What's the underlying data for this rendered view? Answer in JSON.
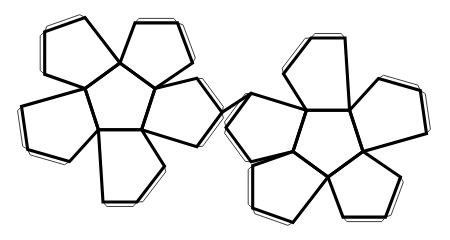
{
  "document": {
    "title": "Dodecahedron Net",
    "subject": "regular dodecahedron papercraft unfolding",
    "background_color": "#ffffff",
    "line_color": "#000000",
    "tab_line_color": "#2a2a2a",
    "face_fill_color": "#ffffff",
    "width": 450,
    "height": 240
  },
  "figure": {
    "type": "polyhedron-net",
    "solid": "dodecahedron",
    "face_shape": "regular pentagon",
    "face_count": 12,
    "group_count": 2,
    "faces_per_group": 6,
    "has_glue_tabs": true,
    "tab_offset_px": 4.5,
    "fold_line_width": 3.1,
    "tab_line_width": 0.9
  },
  "groups": [
    {
      "name": "left-flower",
      "center_x": 120,
      "center_y": 104,
      "orientation_deg": 0,
      "faces": [
        {
          "name": "left-center-face",
          "role": "center",
          "points": "120,63 155,88.5 141.6,129.7 98.4,129.7 85,88.5"
        },
        {
          "name": "left-petal-top-left",
          "role": "petal",
          "points": "120,63 85,88.5 44.7,74.3 44.7,31.8 85,17.6"
        },
        {
          "name": "left-petal-top-right",
          "role": "petal",
          "points": "155,88.5 120,63 135,22.9 177.5,22.9 192.5,63"
        },
        {
          "name": "left-petal-right",
          "role": "petal",
          "points": "141.6,129.7 155,88.5 196.8,78.2 222,112.4 196.8,146.7"
        },
        {
          "name": "left-petal-bottom",
          "role": "petal",
          "points": "98.4,129.7 141.6,129.7 164.5,166.1 137,202 103,202"
        },
        {
          "name": "left-petal-left",
          "role": "petal",
          "points": "85,88.5 98.4,129.7 69.5,161.5 27.7,149.5 21.5,106.4"
        }
      ],
      "tabs": [
        {
          "name": "tab-top-left-outer",
          "edge": "44.7,31.8 85,17.6"
        },
        {
          "name": "tab-top-left-lower",
          "edge": "44.7,74.3 44.7,31.8"
        },
        {
          "name": "tab-top-right-outer",
          "edge": "135,22.9 177.5,22.9"
        },
        {
          "name": "tab-top-right-side",
          "edge": "177.5,22.9 192.5,63"
        },
        {
          "name": "tab-right-upper",
          "edge": "196.8,78.2 222,112.4"
        },
        {
          "name": "tab-right-lower",
          "edge": "222,112.4 196.8,146.7"
        },
        {
          "name": "tab-bottom-right",
          "edge": "164.5,166.1 137,202"
        },
        {
          "name": "tab-bottom-base",
          "edge": "137,202 103,202"
        },
        {
          "name": "tab-bottom-left",
          "edge": "103,202 69.5,161.5"
        },
        {
          "name": "tab-left-lower",
          "edge": "69.5,161.5 27.7,149.5"
        },
        {
          "name": "tab-left-outer",
          "edge": "27.7,149.5 21.5,106.4"
        },
        {
          "name": "tab-left-upper",
          "edge": "21.5,106.4 44.7,74.3"
        }
      ]
    },
    {
      "name": "right-flower",
      "center_x": 328,
      "center_y": 136,
      "orientation_deg": 180,
      "faces": [
        {
          "name": "right-center-face",
          "role": "center",
          "points": "328,177 293,151.5 306.4,110.3 349.6,110.3 363,151.5"
        },
        {
          "name": "right-petal-bottom-left",
          "role": "petal",
          "points": "328,177 293,151.5 252.7,165.7 252.7,208.2 293,222.4"
        },
        {
          "name": "right-petal-bottom-right",
          "role": "petal",
          "points": "363,151.5 328,177 343,217.1 385.5,217.1 400.5,177"
        },
        {
          "name": "right-petal-left",
          "role": "petal",
          "points": "306.4,110.3 293,151.5 251.2,161.8 226,127.6 251.2,93.3"
        },
        {
          "name": "right-petal-top",
          "role": "petal",
          "points": "349.6,110.3 306.4,110.3 283.5,73.9 311,38 345,38"
        },
        {
          "name": "right-petal-right",
          "role": "petal",
          "points": "363,151.5 349.6,110.3 378.5,78.5 420.3,90.5 426.5,133.6"
        }
      ],
      "tabs": [
        {
          "name": "tab-r-bottom-left-outer",
          "edge": "252.7,165.7 252.7,208.2"
        },
        {
          "name": "tab-r-bottom-left-base",
          "edge": "252.7,208.2 293,222.4"
        },
        {
          "name": "tab-r-bottom-right-base",
          "edge": "343,217.1 385.5,217.1"
        },
        {
          "name": "tab-r-bottom-right-side",
          "edge": "385.5,217.1 400.5,177"
        },
        {
          "name": "tab-r-left-lower",
          "edge": "251.2,161.8 226,127.6"
        },
        {
          "name": "tab-r-left-upper",
          "edge": "226,127.6 251.2,93.3"
        },
        {
          "name": "tab-r-top-left",
          "edge": "283.5,73.9 311,38"
        },
        {
          "name": "tab-r-top-apex",
          "edge": "311,38 345,38"
        },
        {
          "name": "tab-r-top-right",
          "edge": "345,38 378.5,78.5"
        },
        {
          "name": "tab-r-right-upper",
          "edge": "378.5,78.5 420.3,90.5"
        },
        {
          "name": "tab-r-right-outer",
          "edge": "420.3,90.5 426.5,133.6"
        },
        {
          "name": "tab-r-right-lower",
          "edge": "426.5,133.6 400.5,177"
        }
      ]
    }
  ],
  "bridge": {
    "name": "connecting-edge",
    "description": "shared fold edge joining the two flowers",
    "edge": "222,112.4 251.2,93.3"
  }
}
